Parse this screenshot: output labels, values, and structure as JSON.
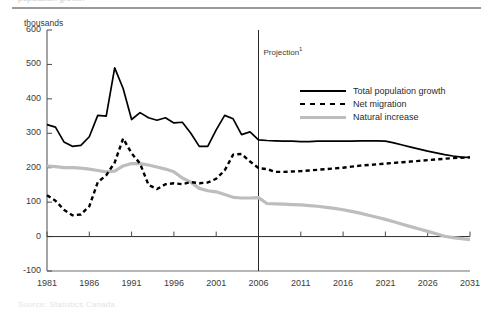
{
  "figure": {
    "units_label": "thousands",
    "clipped_top_text": "population growth",
    "clipped_bottom_text": "Source: Statistics Canada.",
    "projection_label": "Projection",
    "projection_superscript": "1",
    "projection_year": 2006
  },
  "legend": {
    "position": "inside-right-top",
    "items": [
      {
        "label": "Total population growth",
        "style": "solid",
        "color": "#000000"
      },
      {
        "label": "Net migration",
        "style": "dashed",
        "color": "#000000"
      },
      {
        "label": "Natural increase",
        "style": "solid",
        "color": "#bdbdbd"
      }
    ]
  },
  "axes": {
    "y_ticks": [
      600,
      500,
      400,
      300,
      200,
      100,
      0,
      -100
    ],
    "x_ticks": [
      1981,
      1986,
      1991,
      1996,
      2001,
      2006,
      2011,
      2016,
      2021,
      2026,
      2031
    ],
    "ylim": [
      -100,
      600
    ],
    "xlim": [
      1981,
      2031
    ],
    "grid": false
  },
  "chart_data": {
    "type": "line",
    "title": "",
    "subtitle": "",
    "xlabel": "",
    "ylabel": "thousands",
    "ylim": [
      -100,
      600
    ],
    "xlim": [
      1981,
      2031
    ],
    "grid": false,
    "legend_position": "inside-right-top",
    "annotations": [
      {
        "text": "Projection",
        "superscript": "1",
        "x": 2006,
        "type": "vertical-divider"
      }
    ],
    "x": [
      1981,
      1982,
      1983,
      1984,
      1985,
      1986,
      1987,
      1988,
      1989,
      1990,
      1991,
      1992,
      1993,
      1994,
      1995,
      1996,
      1997,
      1998,
      1999,
      2000,
      2001,
      2002,
      2003,
      2004,
      2005,
      2006,
      2007,
      2008,
      2009,
      2010,
      2011,
      2012,
      2013,
      2014,
      2015,
      2016,
      2017,
      2018,
      2019,
      2020,
      2021,
      2022,
      2023,
      2024,
      2025,
      2026,
      2027,
      2028,
      2029,
      2030,
      2031
    ],
    "series": [
      {
        "name": "Total population growth",
        "style": "solid",
        "color": "#000000",
        "values": [
          325,
          318,
          275,
          262,
          265,
          290,
          352,
          350,
          490,
          430,
          340,
          360,
          345,
          338,
          345,
          330,
          332,
          300,
          262,
          262,
          310,
          352,
          342,
          296,
          304,
          281,
          279,
          278,
          277,
          277,
          276,
          276,
          277,
          277,
          277,
          277,
          277,
          278,
          278,
          278,
          277,
          272,
          266,
          260,
          254,
          248,
          243,
          238,
          234,
          231,
          230
        ]
      },
      {
        "name": "Net migration",
        "style": "dashed",
        "color": "#000000",
        "values": [
          120,
          104,
          78,
          62,
          64,
          88,
          158,
          178,
          215,
          285,
          242,
          212,
          150,
          138,
          152,
          155,
          152,
          158,
          155,
          157,
          168,
          192,
          238,
          240,
          218,
          199,
          196,
          188,
          188,
          189,
          190,
          192,
          194,
          196,
          198,
          200,
          203,
          206,
          208,
          210,
          212,
          214,
          216,
          218,
          220,
          222,
          224,
          226,
          228,
          229,
          230
        ]
      },
      {
        "name": "Natural increase",
        "style": "solid",
        "color": "#bdbdbd",
        "values": [
          205,
          203,
          200,
          200,
          199,
          196,
          192,
          188,
          190,
          205,
          212,
          212,
          208,
          202,
          196,
          188,
          170,
          158,
          140,
          133,
          130,
          122,
          114,
          112,
          112,
          113,
          96,
          95,
          94,
          93,
          92,
          90,
          88,
          85,
          82,
          78,
          73,
          68,
          62,
          56,
          50,
          43,
          36,
          29,
          22,
          15,
          8,
          1,
          -3,
          -6,
          -9
        ]
      }
    ]
  }
}
